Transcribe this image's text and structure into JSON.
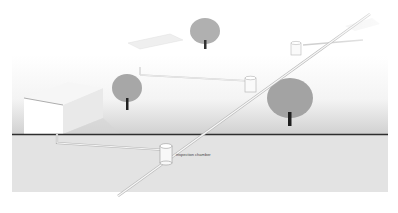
{
  "diagram": {
    "type": "drainage-system-illustration",
    "labels": {
      "inspection_chamber": "inspection chamber"
    },
    "colors": {
      "background": "#ffffff",
      "above_ground_gradient_top": "#ffffff",
      "above_ground_gradient_bottom": "#d2d2d2",
      "ground_section": "#e2e2e2",
      "ground_line": "#333333",
      "tree": "#a9a9a9",
      "trunk": "#222222",
      "pipe": "#f4f4f4",
      "pipe_outline": "#b0b0b0"
    },
    "elements": [
      {
        "name": "house",
        "kind": "building"
      },
      {
        "name": "tree-left",
        "kind": "tree"
      },
      {
        "name": "tree-back",
        "kind": "tree"
      },
      {
        "name": "tree-right",
        "kind": "tree"
      },
      {
        "name": "inspection-chamber-main",
        "kind": "chamber"
      },
      {
        "name": "chamber-middle",
        "kind": "chamber"
      },
      {
        "name": "chamber-far",
        "kind": "chamber"
      },
      {
        "name": "main-sewer-pipe",
        "kind": "pipe"
      },
      {
        "name": "house-drain-pipe",
        "kind": "pipe"
      },
      {
        "name": "branch-pipe-left",
        "kind": "pipe"
      },
      {
        "name": "branch-pipe-far",
        "kind": "pipe"
      }
    ]
  }
}
